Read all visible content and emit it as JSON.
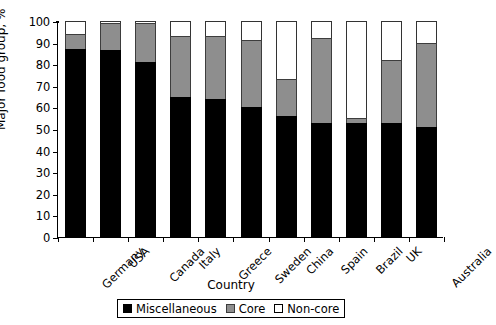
{
  "chart_data": {
    "type": "bar",
    "subtype": "stacked-bar-100",
    "title": "",
    "xlabel": "Country",
    "ylabel": "Major food group, %",
    "ylim": [
      0,
      100
    ],
    "yticks": [
      0,
      10,
      20,
      30,
      40,
      50,
      60,
      70,
      80,
      90,
      100
    ],
    "grid": false,
    "legend_position": "bottom-center",
    "categories": [
      "Germany",
      "USA",
      "Canada",
      "Italy",
      "Greece",
      "Sweden",
      "China",
      "Spain",
      "Brazil",
      "UK",
      "Australia"
    ],
    "series": [
      {
        "name": "Miscellaneous",
        "color": "#000000",
        "values": [
          87,
          86.5,
          81,
          65,
          64,
          60,
          56,
          53,
          53,
          53,
          51
        ]
      },
      {
        "name": "Core",
        "color": "#8e8e8e",
        "values": [
          7,
          12.5,
          18,
          28,
          29,
          31,
          17,
          39,
          2,
          29,
          39
        ]
      },
      {
        "name": "Non-core",
        "color": "#ffffff",
        "values": [
          6,
          1,
          1,
          7,
          7,
          9,
          27,
          8,
          45,
          18,
          10
        ]
      }
    ],
    "cumulative_tops": {
      "Miscellaneous": [
        87,
        86.5,
        81,
        65,
        64,
        60,
        56,
        53,
        53,
        53,
        51
      ],
      "Core": [
        94,
        99,
        99,
        93,
        93,
        91,
        73,
        92,
        55,
        82,
        90
      ],
      "Non-core": [
        100,
        100,
        100,
        100,
        100,
        100,
        100,
        100,
        100,
        100,
        100
      ]
    }
  },
  "legend": {
    "items": [
      {
        "label": "Miscellaneous",
        "swatch": "black-square-icon"
      },
      {
        "label": "Core",
        "swatch": "gray-square-icon"
      },
      {
        "label": "Non-core",
        "swatch": "white-square-icon"
      }
    ]
  }
}
